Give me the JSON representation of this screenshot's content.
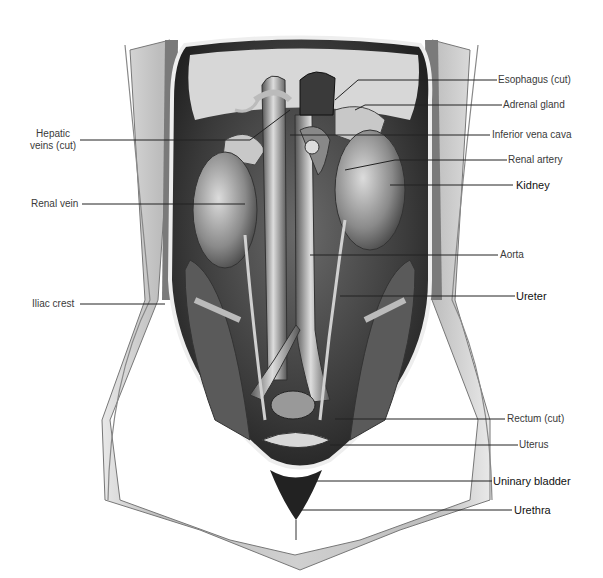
{
  "diagram": {
    "colors": {
      "background": "#ffffff",
      "line": "#222222",
      "label": "#3a3a3a",
      "label_strong": "#111111"
    },
    "labels_left": [
      {
        "id": "hepatic-veins",
        "text_line1": "Hepatic",
        "text_line2": "veins (cut)"
      },
      {
        "id": "renal-vein",
        "text": "Renal vein"
      },
      {
        "id": "iliac-crest",
        "text": "Iliac crest"
      }
    ],
    "labels_right": [
      {
        "id": "esophagus",
        "text": "Esophagus (cut)"
      },
      {
        "id": "adrenal-gland",
        "text": "Adrenal gland"
      },
      {
        "id": "inferior-vena-cava",
        "text": "Inferior vena cava"
      },
      {
        "id": "renal-artery",
        "text": "Renal artery"
      },
      {
        "id": "kidney",
        "text": "Kidney"
      },
      {
        "id": "aorta",
        "text": "Aorta"
      },
      {
        "id": "ureter",
        "text": "Ureter"
      },
      {
        "id": "rectum",
        "text": "Rectum (cut)"
      },
      {
        "id": "uterus",
        "text": "Uterus"
      },
      {
        "id": "urinary-bladder",
        "text": "Uninary bladder"
      },
      {
        "id": "urethra",
        "text": "Urethra"
      }
    ]
  }
}
